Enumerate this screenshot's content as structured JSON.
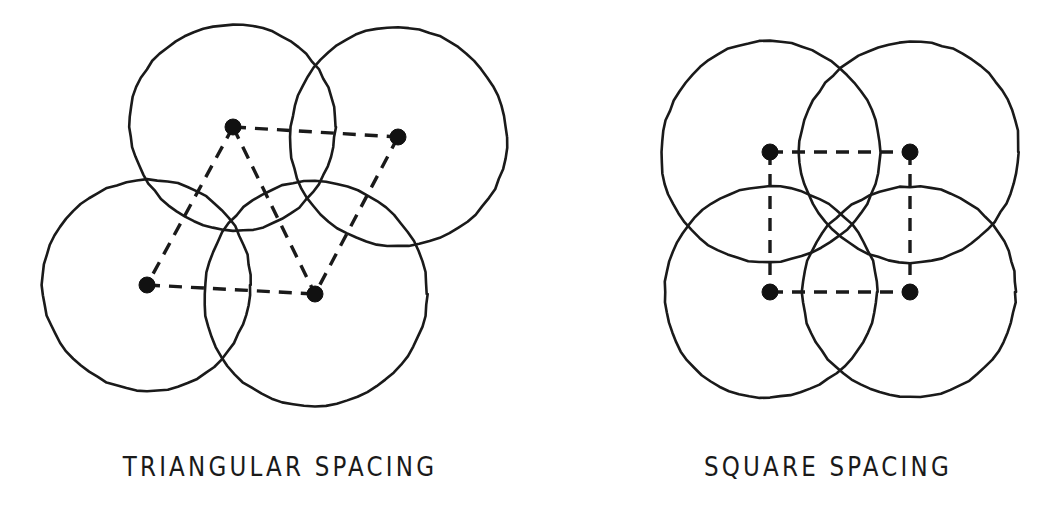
{
  "figure": {
    "width": 1059,
    "height": 524,
    "background_color": "#ffffff",
    "stroke_color": "#1a1a1a",
    "dot_color": "#111111"
  },
  "panels": [
    {
      "id": "triangular",
      "caption": "TRIANGULAR SPACING",
      "caption_x": 280,
      "caption_y": 468,
      "circles": [
        {
          "name": "circle-top-left",
          "cx": 233,
          "cy": 127,
          "r": 103
        },
        {
          "name": "circle-top-right",
          "cx": 398,
          "cy": 137,
          "r": 109
        },
        {
          "name": "circle-bottom-left",
          "cx": 147,
          "cy": 285,
          "r": 105
        },
        {
          "name": "circle-bottom-right",
          "cx": 315,
          "cy": 294,
          "r": 112
        }
      ],
      "centers": [
        {
          "name": "center-dot-top-left",
          "cx": 233,
          "cy": 127,
          "r": 8
        },
        {
          "name": "center-dot-top-right",
          "cx": 398,
          "cy": 137,
          "r": 8
        },
        {
          "name": "center-dot-bottom-left",
          "cx": 147,
          "cy": 285,
          "r": 8
        },
        {
          "name": "center-dot-bottom-right",
          "cx": 315,
          "cy": 294,
          "r": 8
        }
      ],
      "connectors": [
        {
          "name": "connector-top",
          "x1": 233,
          "y1": 127,
          "x2": 398,
          "y2": 137
        },
        {
          "name": "connector-bottom",
          "x1": 147,
          "y1": 285,
          "x2": 315,
          "y2": 294
        },
        {
          "name": "connector-left-diagonal",
          "x1": 233,
          "y1": 127,
          "x2": 147,
          "y2": 285
        },
        {
          "name": "connector-mid-diagonal",
          "x1": 233,
          "y1": 127,
          "x2": 315,
          "y2": 294
        },
        {
          "name": "connector-right-diagonal",
          "x1": 398,
          "y1": 137,
          "x2": 315,
          "y2": 294
        }
      ]
    },
    {
      "id": "square",
      "caption": "SQUARE SPACING",
      "caption_x": 828,
      "caption_y": 468,
      "circles": [
        {
          "name": "circle-top-left",
          "cx": 770,
          "cy": 152,
          "r": 110
        },
        {
          "name": "circle-top-right",
          "cx": 910,
          "cy": 152,
          "r": 110
        },
        {
          "name": "circle-bottom-left",
          "cx": 770,
          "cy": 292,
          "r": 106
        },
        {
          "name": "circle-bottom-right",
          "cx": 910,
          "cy": 292,
          "r": 106
        }
      ],
      "centers": [
        {
          "name": "center-dot-top-left",
          "cx": 770,
          "cy": 152,
          "r": 8
        },
        {
          "name": "center-dot-top-right",
          "cx": 910,
          "cy": 152,
          "r": 8
        },
        {
          "name": "center-dot-bottom-left",
          "cx": 770,
          "cy": 292,
          "r": 8
        },
        {
          "name": "center-dot-bottom-right",
          "cx": 910,
          "cy": 292,
          "r": 8
        }
      ],
      "connectors": [
        {
          "name": "connector-top",
          "x1": 770,
          "y1": 152,
          "x2": 910,
          "y2": 152
        },
        {
          "name": "connector-bottom",
          "x1": 770,
          "y1": 292,
          "x2": 910,
          "y2": 292
        },
        {
          "name": "connector-left",
          "x1": 770,
          "y1": 152,
          "x2": 770,
          "y2": 292
        },
        {
          "name": "connector-right",
          "x1": 910,
          "y1": 152,
          "x2": 910,
          "y2": 292
        }
      ]
    }
  ],
  "style": {
    "circle_stroke_width": 2.6,
    "connector_stroke_width": 3.4,
    "connector_dash": "13 9"
  }
}
